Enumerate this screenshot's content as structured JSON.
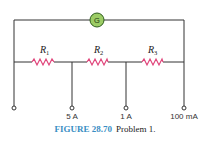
{
  "diagram": {
    "galvanometer": {
      "label": "G",
      "fill": "#9ccc65",
      "stroke": "#2e5e1e"
    },
    "resistors": [
      {
        "name": "R",
        "sub": "1"
      },
      {
        "name": "R",
        "sub": "2"
      },
      {
        "name": "R",
        "sub": "3"
      }
    ],
    "resistor_color": "#e0457b",
    "terminals": [
      "",
      "5 A",
      "1 A",
      "100 mA"
    ]
  },
  "caption": {
    "figure": "FIGURE 28.70",
    "text": "Problem 1."
  }
}
